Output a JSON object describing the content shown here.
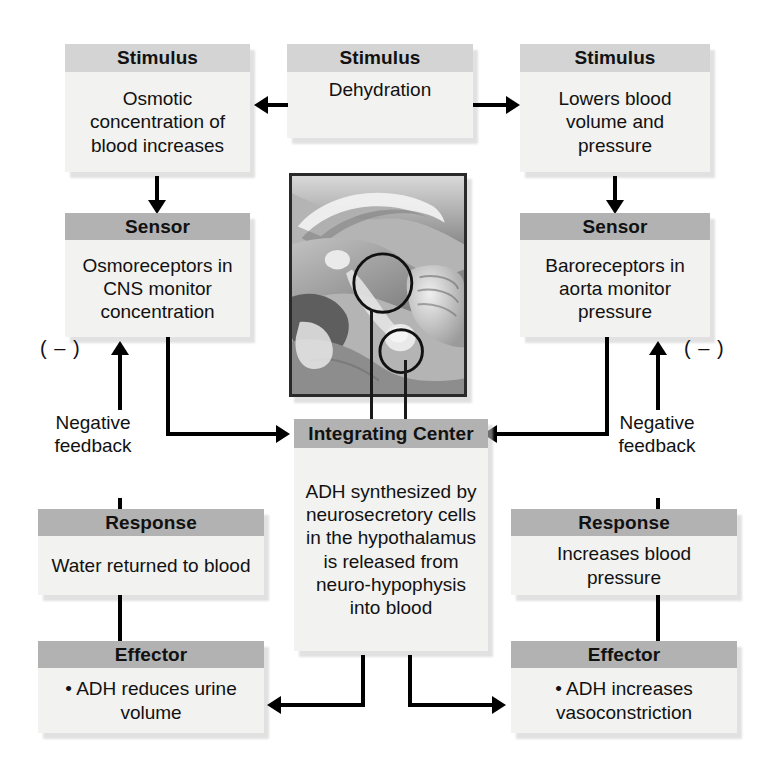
{
  "diagram": {
    "colors": {
      "header_light": "#d4d4d4",
      "header_mid": "#b2b2b2",
      "body_fill": "#f2f2f0",
      "line": "#000000",
      "shadow": "#c9c9c9"
    }
  },
  "boxes": {
    "stimulus_left": {
      "header": "Stimulus",
      "text": "Osmotic concentration of blood increases"
    },
    "stimulus_center": {
      "header": "Stimulus",
      "text": "Dehydration"
    },
    "stimulus_right": {
      "header": "Stimulus",
      "text": "Lowers blood volume and pressure"
    },
    "sensor_left": {
      "header": "Sensor",
      "text": "Osmoreceptors in CNS monitor concentration"
    },
    "sensor_right": {
      "header": "Sensor",
      "text": "Baroreceptors in aorta monitor pressure"
    },
    "integrating_center": {
      "header": "Integrating Center",
      "text": "ADH synthesized by neurosecretory cells in the hypothalamus is released from neuro-hypophysis into blood"
    },
    "response_left": {
      "header": "Response",
      "text": "Water returned to blood"
    },
    "response_right": {
      "header": "Response",
      "text": "Increases blood pressure"
    },
    "effector_left": {
      "header": "Effector",
      "text": "• ADH reduces urine volume"
    },
    "effector_right": {
      "header": "Effector",
      "text": "• ADH increases vasoconstriction"
    }
  },
  "labels": {
    "feedback_left": "Negative feedback",
    "feedback_right": "Negative feedback",
    "minus_left": "( – )",
    "minus_right": "( – )"
  },
  "illustration": {
    "name": "midsagittal-brain-hypothalamus-pituitary",
    "callouts": [
      "hypothalamus-circle",
      "neurohypophysis-circle"
    ]
  }
}
